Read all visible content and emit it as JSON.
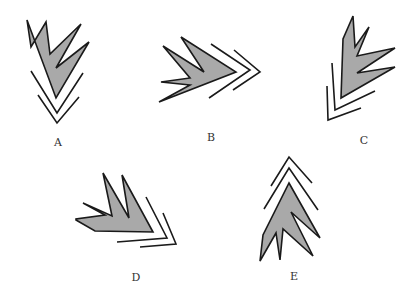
{
  "colors": {
    "fill": "#a9a9a9",
    "stroke": "#1a1a1a",
    "label": "#333333",
    "background": "#ffffff"
  },
  "figures": [
    {
      "id": "A",
      "label": "A",
      "label_pos": [
        58,
        146
      ],
      "polygon": "27,20 31,47 46,22 50,54 81,24 56,68 89,42 56,98",
      "chevrons": [
        "31,71 57,113 83,73",
        "38,95 57,123 79,97"
      ]
    },
    {
      "id": "B",
      "label": "B",
      "label_pos": [
        211,
        141
      ],
      "polygon": "163,46 204,72 181,37 236,72 159,102 190,85 161,82 190,78",
      "chevrons": [
        "211,44 250,70 209,98",
        "234,50 260,72 233,90"
      ]
    },
    {
      "id": "C",
      "label": "C",
      "label_pos": [
        364,
        144
      ],
      "polygon": "353,16 343,39 341,98 395,67 357,73 395,48 357,56 369,27 355,47",
      "chevrons": [
        "332,63 335,110 375,91",
        "327,86 328,120 361,108"
      ]
    },
    {
      "id": "D",
      "label": "D",
      "label_pos": [
        136,
        281
      ],
      "polygon": "76,220 95,231 153,232 122,175 129,218 103,173 112,216 83,203 105,215 76,219",
      "chevrons": [
        "146,197 167,238 117,242",
        "163,213 176,244 140,247"
      ]
    },
    {
      "id": "E",
      "label": "E",
      "label_pos": [
        294,
        280
      ],
      "polygon": "289,183 320,238 291,212 313,256 283,229 280,260 276,233 260,261 263,235",
      "chevrons": [
        "271,186 289,157 312,183",
        "264,209 289,168 318,210"
      ]
    }
  ]
}
